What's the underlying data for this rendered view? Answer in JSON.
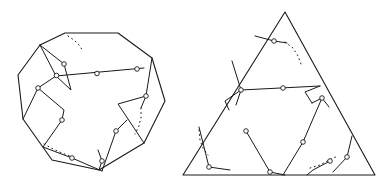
{
  "page": {
    "background_color": "#ffffff",
    "width": 390,
    "height": 191,
    "stroke_color": "#1a1a1a",
    "marker_fill": "#ffffff",
    "caption": ""
  },
  "figures": [
    {
      "id": "left-figure",
      "name": "octagon-dissection",
      "label": "",
      "shape_type": "convex-octagon",
      "outline_points": "65,33 118,33 152,58 165,101 144,143 99,170 52,160 23,119 18,75 40,45",
      "node_markers": [
        {
          "type": "circle",
          "x": 56.5,
          "y": 75.5
        },
        {
          "type": "circle",
          "x": 97,
          "y": 73.5
        },
        {
          "type": "circle",
          "x": 137,
          "y": 69
        },
        {
          "type": "circle",
          "x": 64,
          "y": 64
        },
        {
          "type": "circle",
          "x": 38,
          "y": 88
        },
        {
          "type": "circle",
          "x": 62,
          "y": 120
        },
        {
          "type": "circle",
          "x": 116,
          "y": 131
        },
        {
          "type": "circle",
          "x": 146,
          "y": 96
        },
        {
          "type": "circle",
          "x": 72,
          "y": 158
        },
        {
          "type": "circle",
          "x": 102,
          "y": 161
        }
      ],
      "dotted_arcs": [
        "68,36 74,40 79,45 83,51",
        "141,108 141,117 139,126 135,134",
        "44,144 53,149 62,153 70,156"
      ],
      "chords": [
        "56,76 144,68",
        "40,45 64,64 71,90 56,76 40,45",
        "23,119 38,88 56,76",
        "38,88 64,110 62,120",
        "62,120 43,147 72,158 102,171",
        "102,171 116,131 127,120",
        "152,58 146,96 141,108",
        "144,143 118,104 146,96",
        "99,170 102,161 98,150"
      ]
    },
    {
      "id": "right-figure",
      "name": "triangle-dissection",
      "label": "",
      "shape_type": "triangle",
      "outline_points": "285,12 375,175 183,175",
      "node_markers": [
        {
          "type": "circle",
          "x": 274,
          "y": 41
        },
        {
          "type": "circle",
          "x": 283,
          "y": 88
        },
        {
          "type": "circle",
          "x": 241,
          "y": 90
        },
        {
          "type": "circle",
          "x": 322,
          "y": 98
        },
        {
          "type": "circle",
          "x": 246,
          "y": 131
        },
        {
          "type": "circle",
          "x": 303,
          "y": 142
        },
        {
          "type": "circle",
          "x": 347,
          "y": 157
        },
        {
          "type": "circle",
          "x": 209,
          "y": 167
        },
        {
          "type": "circle",
          "x": 270,
          "y": 172
        },
        {
          "type": "circle",
          "x": 330,
          "y": 161
        }
      ],
      "dotted_arcs": [
        "285,42 293,48 298,56 301,64",
        "199,130 200,140 203,148 208,155",
        "310,168 320,165 329,160 338,156"
      ],
      "chords": [
        "241,90 320,86",
        "255,36 274,41 287,43",
        "232,61 241,90 236,105",
        "241,90 225,101 229,110",
        "320,86 305,92 312,103",
        "312,103 322,98 329,107",
        "322,98 303,142 283,175",
        "246,131 270,172 285,175",
        "199,127 209,167 230,170",
        "352,136 347,157 333,172",
        "330,161 313,170 307,175"
      ]
    }
  ]
}
